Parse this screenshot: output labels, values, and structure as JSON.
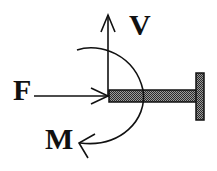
{
  "diagram": {
    "type": "free-body diagram of cantilever beam end",
    "labels": {
      "shear": "V",
      "axial_force": "F",
      "moment": "M"
    },
    "colors": {
      "stroke": "#111111",
      "beam_fill": "#5a5a5a",
      "background": "#ffffff"
    }
  }
}
